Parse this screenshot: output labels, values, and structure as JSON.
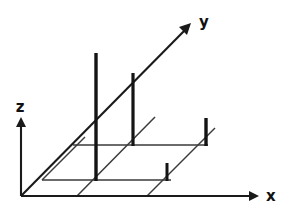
{
  "figure": {
    "type": "line-drawing",
    "background_color": "#ffffff",
    "ink_color": "#1a1a1a",
    "width": 283,
    "height": 213
  },
  "axes": {
    "origin": {
      "x": 21,
      "y": 196
    },
    "x_axis": {
      "label": "x",
      "label_pos": {
        "x": 266,
        "y": 196
      },
      "start": {
        "x": 21,
        "y": 196
      },
      "end": {
        "x": 254,
        "y": 196
      },
      "arrow": true
    },
    "y_axis": {
      "label": "y",
      "label_pos": {
        "x": 199,
        "y": 22
      },
      "start": {
        "x": 21,
        "y": 196
      },
      "end": {
        "x": 188,
        "y": 27
      },
      "arrow": true
    },
    "z_axis": {
      "label": "z",
      "label_pos": {
        "x": 20,
        "y": 107
      },
      "start": {
        "x": 21,
        "y": 196
      },
      "end": {
        "x": 21,
        "y": 121
      },
      "arrow": true
    }
  },
  "grid": {
    "horizontal_lines": [
      {
        "name": "grid-row-back",
        "x1": 73,
        "y1": 145,
        "x2": 208,
        "y2": 145
      },
      {
        "name": "grid-row-front",
        "x1": 42,
        "y1": 180,
        "x2": 171,
        "y2": 180
      }
    ],
    "diagonal_lines": [
      {
        "name": "grid-diag-1",
        "x1": 42,
        "y1": 180,
        "x2": 85,
        "y2": 137
      },
      {
        "name": "grid-diag-2",
        "x1": 77,
        "y1": 196,
        "x2": 155,
        "y2": 117
      },
      {
        "name": "grid-diag-3",
        "x1": 147,
        "y1": 196,
        "x2": 215,
        "y2": 128
      }
    ]
  },
  "chart_data": {
    "type": "bar",
    "xlabel": "x",
    "ylabel": "y",
    "zlabel": "z",
    "bars": [
      {
        "name": "bar-tall",
        "x": 96,
        "base_y": 181,
        "top_y": 53,
        "height_px": 128,
        "thickness": 3.4
      },
      {
        "name": "bar-medium",
        "x": 133,
        "base_y": 146,
        "top_y": 73,
        "height_px": 73,
        "thickness": 3.2
      },
      {
        "name": "bar-short-right",
        "x": 206,
        "base_y": 146,
        "top_y": 118,
        "height_px": 28,
        "thickness": 3.4
      },
      {
        "name": "bar-tiny",
        "x": 167,
        "base_y": 181,
        "top_y": 163,
        "height_px": 18,
        "thickness": 3.0
      }
    ],
    "grid": true,
    "legend": null
  }
}
